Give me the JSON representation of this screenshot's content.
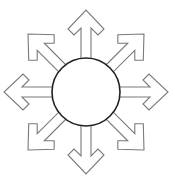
{
  "diagram": {
    "type": "radial-arrows",
    "center": {
      "x": 86,
      "y": 92
    },
    "hub_radius": 34,
    "colors": {
      "background": "#ffffff",
      "arrow_stroke": "#7a7a7a",
      "arrow_fill": "#ffffff",
      "hub_stroke": "#222222",
      "hub_fill": "#ffffff"
    },
    "arrows": [
      {
        "direction": "up",
        "angle": 0
      },
      {
        "direction": "up-right",
        "angle": 45
      },
      {
        "direction": "right",
        "angle": 90
      },
      {
        "direction": "down-right",
        "angle": 135
      },
      {
        "direction": "down",
        "angle": 180
      },
      {
        "direction": "down-left",
        "angle": 225
      },
      {
        "direction": "left",
        "angle": 270
      },
      {
        "direction": "up-left",
        "angle": 315
      }
    ]
  }
}
